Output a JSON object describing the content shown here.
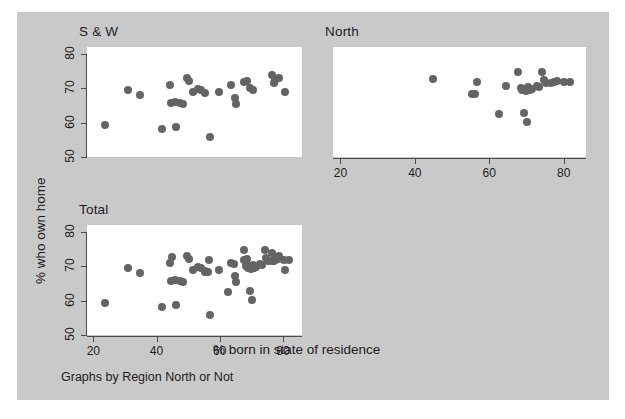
{
  "figure": {
    "background_color": "#c9c9c9",
    "plot_background_color": "#ffffff",
    "marker_color": "#646464",
    "axis_color": "#4a4a4a",
    "y_axis_title": "% who own home",
    "x_axis_title": "% born in state of residence",
    "caption": "Graphs by Region North or Not"
  },
  "chart_data": {
    "type": "scatter",
    "title": "",
    "xlabel": "% born in state of residence",
    "ylabel": "% who own home",
    "caption": "Graphs by Region North or Not",
    "grid": false,
    "legend": "none",
    "layout": "3 panels by group (S & W top-left, North top-right, Total bottom-left)",
    "xlim": [
      18,
      86
    ],
    "ylim": [
      50,
      82
    ],
    "xticks": [
      20,
      40,
      60,
      80
    ],
    "yticks": [
      50,
      60,
      70,
      80
    ],
    "xticklabels": [
      "20",
      "40",
      "60",
      "80"
    ],
    "yticklabels": [
      "50",
      "60",
      "70",
      "80"
    ],
    "panels": [
      {
        "name": "S & W",
        "label": "S & W",
        "points": [
          [
            23.8,
            59.4
          ],
          [
            30.9,
            69.6
          ],
          [
            34.8,
            68.0
          ],
          [
            41.8,
            58.1
          ],
          [
            44.3,
            70.9
          ],
          [
            44.6,
            65.8
          ],
          [
            45.9,
            65.9
          ],
          [
            46.3,
            58.6
          ],
          [
            47.4,
            65.6
          ],
          [
            48.3,
            65.3
          ],
          [
            49.7,
            72.9
          ],
          [
            50.3,
            72.2
          ],
          [
            51.6,
            68.8
          ],
          [
            53.1,
            69.9
          ],
          [
            54.1,
            69.5
          ],
          [
            55.2,
            68.6
          ],
          [
            56.8,
            55.9
          ],
          [
            59.9,
            68.8
          ],
          [
            63.6,
            70.9
          ],
          [
            64.8,
            67.3
          ],
          [
            65.0,
            65.4
          ],
          [
            67.6,
            71.7
          ],
          [
            68.5,
            72.0
          ],
          [
            69.5,
            70.0
          ],
          [
            70.5,
            69.5
          ],
          [
            76.5,
            73.8
          ],
          [
            77.0,
            71.5
          ],
          [
            77.5,
            72.3
          ],
          [
            78.8,
            73.0
          ],
          [
            80.5,
            68.8
          ]
        ]
      },
      {
        "name": "North",
        "label": "North",
        "points": [
          [
            45.0,
            72.6
          ],
          [
            55.3,
            68.2
          ],
          [
            56.3,
            68.3
          ],
          [
            56.6,
            71.8
          ],
          [
            62.6,
            62.4
          ],
          [
            64.5,
            70.6
          ],
          [
            67.8,
            74.8
          ],
          [
            68.4,
            70.2
          ],
          [
            68.9,
            69.5
          ],
          [
            69.4,
            62.7
          ],
          [
            69.9,
            69.2
          ],
          [
            70.2,
            60.3
          ],
          [
            70.4,
            70.3
          ],
          [
            70.9,
            69.4
          ],
          [
            71.5,
            69.7
          ],
          [
            72.7,
            70.6
          ],
          [
            73.4,
            70.3
          ],
          [
            74.2,
            74.6
          ],
          [
            74.6,
            72.4
          ],
          [
            75.3,
            71.6
          ],
          [
            76.6,
            71.5
          ],
          [
            77.5,
            71.9
          ],
          [
            78.3,
            72.1
          ],
          [
            80.2,
            71.8
          ],
          [
            81.8,
            71.7
          ]
        ]
      },
      {
        "name": "Total",
        "label": "Total",
        "points": [
          [
            23.8,
            59.4
          ],
          [
            30.9,
            69.6
          ],
          [
            34.8,
            68.0
          ],
          [
            41.8,
            58.1
          ],
          [
            44.3,
            70.9
          ],
          [
            44.6,
            65.8
          ],
          [
            45.0,
            72.6
          ],
          [
            45.9,
            65.9
          ],
          [
            46.3,
            58.6
          ],
          [
            47.4,
            65.6
          ],
          [
            48.3,
            65.3
          ],
          [
            49.7,
            72.9
          ],
          [
            50.3,
            72.2
          ],
          [
            51.6,
            68.8
          ],
          [
            53.1,
            69.9
          ],
          [
            54.1,
            69.5
          ],
          [
            55.2,
            68.6
          ],
          [
            55.3,
            68.2
          ],
          [
            56.3,
            68.3
          ],
          [
            56.6,
            71.8
          ],
          [
            56.8,
            55.9
          ],
          [
            59.9,
            68.8
          ],
          [
            62.6,
            62.4
          ],
          [
            63.6,
            70.9
          ],
          [
            64.5,
            70.6
          ],
          [
            64.8,
            67.3
          ],
          [
            65.0,
            65.4
          ],
          [
            67.6,
            71.7
          ],
          [
            67.8,
            74.8
          ],
          [
            68.4,
            70.2
          ],
          [
            68.5,
            72.0
          ],
          [
            68.9,
            69.5
          ],
          [
            69.4,
            62.7
          ],
          [
            69.5,
            70.0
          ],
          [
            69.9,
            69.2
          ],
          [
            70.2,
            60.3
          ],
          [
            70.4,
            70.3
          ],
          [
            70.5,
            69.5
          ],
          [
            70.9,
            69.4
          ],
          [
            71.5,
            69.7
          ],
          [
            72.7,
            70.6
          ],
          [
            73.4,
            70.3
          ],
          [
            74.2,
            74.6
          ],
          [
            74.6,
            72.4
          ],
          [
            75.3,
            71.6
          ],
          [
            76.5,
            73.8
          ],
          [
            76.6,
            71.5
          ],
          [
            77.0,
            71.5
          ],
          [
            77.5,
            72.3
          ],
          [
            77.5,
            71.9
          ],
          [
            78.3,
            72.1
          ],
          [
            78.8,
            73.0
          ],
          [
            80.2,
            71.8
          ],
          [
            80.5,
            68.8
          ],
          [
            81.8,
            71.7
          ]
        ]
      }
    ]
  }
}
